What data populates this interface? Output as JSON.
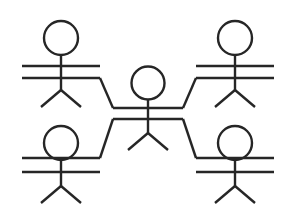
{
  "diagram": {
    "type": "node-link",
    "canvas": {
      "width": 296,
      "height": 218
    },
    "style": {
      "background_color": "#ffffff",
      "line_color": "#262626",
      "line_width": 2.4,
      "head_fill": "none"
    },
    "figure_count": 5,
    "link_count": 4,
    "figures": [
      {
        "id": "figure-top-left",
        "label": "",
        "role": "peer",
        "head": {
          "cx": 61,
          "cy": 38,
          "r": 17
        },
        "spine": {
          "x": 61,
          "y1": 55,
          "y2": 90
        },
        "arms": [
          {
            "name": "arm-upper",
            "x1": 22,
            "y1": 66,
            "x2": 100,
            "y2": 66
          },
          {
            "name": "arm-lower",
            "x1": 22,
            "y1": 78,
            "x2": 100,
            "y2": 78
          }
        ],
        "legs": [
          {
            "name": "leg-left",
            "x1": 61,
            "y1": 90,
            "x2": 41,
            "y2": 107
          },
          {
            "name": "leg-right",
            "x1": 61,
            "y1": 90,
            "x2": 81,
            "y2": 107
          }
        ]
      },
      {
        "id": "figure-top-right",
        "label": "",
        "role": "peer",
        "head": {
          "cx": 235,
          "cy": 38,
          "r": 17
        },
        "spine": {
          "x": 235,
          "y1": 55,
          "y2": 90
        },
        "arms": [
          {
            "name": "arm-upper",
            "x1": 196,
            "y1": 66,
            "x2": 274,
            "y2": 66
          },
          {
            "name": "arm-lower",
            "x1": 196,
            "y1": 78,
            "x2": 274,
            "y2": 78
          }
        ],
        "legs": [
          {
            "name": "leg-left",
            "x1": 235,
            "y1": 90,
            "x2": 215,
            "y2": 107
          },
          {
            "name": "leg-right",
            "x1": 235,
            "y1": 90,
            "x2": 255,
            "y2": 107
          }
        ]
      },
      {
        "id": "figure-center",
        "label": "",
        "role": "hub",
        "head": {
          "cx": 148,
          "cy": 83,
          "r": 16.5
        },
        "spine": {
          "x": 148,
          "y1": 99,
          "y2": 133
        },
        "arms": [
          {
            "name": "arm-upper",
            "x1": 113,
            "y1": 108,
            "x2": 183,
            "y2": 108
          },
          {
            "name": "arm-lower",
            "x1": 113,
            "y1": 119,
            "x2": 183,
            "y2": 119
          }
        ],
        "legs": [
          {
            "name": "leg-left",
            "x1": 148,
            "y1": 133,
            "x2": 128,
            "y2": 150
          },
          {
            "name": "leg-right",
            "x1": 148,
            "y1": 133,
            "x2": 168,
            "y2": 150
          }
        ]
      },
      {
        "id": "figure-bottom-left",
        "label": "",
        "role": "peer",
        "head": {
          "cx": 61,
          "cy": 143,
          "r": 17
        },
        "spine": {
          "x": 61,
          "y1": 160,
          "y2": 186
        },
        "arms": [
          {
            "name": "arm-upper",
            "x1": 22,
            "y1": 158,
            "x2": 100,
            "y2": 158
          },
          {
            "name": "arm-lower",
            "x1": 22,
            "y1": 172,
            "x2": 100,
            "y2": 172
          }
        ],
        "legs": [
          {
            "name": "leg-left",
            "x1": 61,
            "y1": 186,
            "x2": 41,
            "y2": 203
          },
          {
            "name": "leg-right",
            "x1": 61,
            "y1": 186,
            "x2": 81,
            "y2": 203
          }
        ]
      },
      {
        "id": "figure-bottom-right",
        "label": "",
        "role": "peer",
        "head": {
          "cx": 235,
          "cy": 143,
          "r": 17
        },
        "spine": {
          "x": 235,
          "y1": 160,
          "y2": 186
        },
        "arms": [
          {
            "name": "arm-upper",
            "x1": 196,
            "y1": 158,
            "x2": 274,
            "y2": 158
          },
          {
            "name": "arm-lower",
            "x1": 196,
            "y1": 172,
            "x2": 274,
            "y2": 172
          }
        ],
        "legs": [
          {
            "name": "leg-left",
            "x1": 235,
            "y1": 186,
            "x2": 215,
            "y2": 203
          },
          {
            "name": "leg-right",
            "x1": 235,
            "y1": 186,
            "x2": 255,
            "y2": 203
          }
        ]
      }
    ],
    "links": [
      {
        "id": "link-top-left-to-center",
        "from": "figure-top-left",
        "to": "figure-center",
        "label": "",
        "path": "M 100 78 L 113 108"
      },
      {
        "id": "link-top-right-to-center",
        "from": "figure-top-right",
        "to": "figure-center",
        "label": "",
        "path": "M 196 78 L 183 108"
      },
      {
        "id": "link-bottom-left-to-center",
        "from": "figure-bottom-left",
        "to": "figure-center",
        "label": "",
        "path": "M 100 158 L 113 119"
      },
      {
        "id": "link-bottom-right-to-center",
        "from": "figure-bottom-right",
        "to": "figure-center",
        "label": "",
        "path": "M 196 158 L 183 119"
      }
    ]
  }
}
